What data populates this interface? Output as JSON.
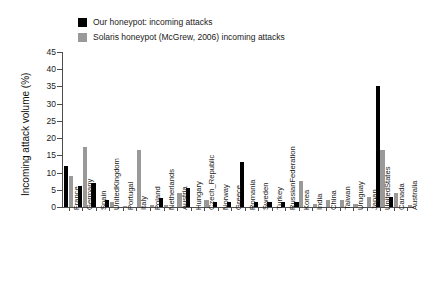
{
  "legend": {
    "position": "top-center",
    "entries": [
      {
        "label": "Our honeypot: incoming attacks",
        "color": "#000000",
        "swatch_name": "legend-swatch-our-honeypot"
      },
      {
        "label": "Solaris honeypot (McGrew, 2006) incoming attacks",
        "color": "#999999",
        "swatch_name": "legend-swatch-solaris-honeypot"
      }
    ]
  },
  "axes": {
    "ylabel": "Incoming attack volume (%)",
    "xlabel": "",
    "yticks": [
      0,
      5,
      10,
      15,
      20,
      25,
      30,
      35,
      40,
      45
    ],
    "ylim": [
      0,
      45
    ],
    "grid": false
  },
  "chart_data": {
    "type": "bar",
    "title": "",
    "xlabel": "",
    "ylabel": "Incoming attack volume (%)",
    "ylim": [
      0,
      45
    ],
    "grid": false,
    "legend_position": "top-center",
    "categories": [
      "France",
      "Germany",
      "Spain",
      "UnitedKingdom",
      "Portugal",
      "Italy",
      "Poland",
      "Netherlands",
      "Austria",
      "Hungary",
      "Czech_Republic",
      "Norway",
      "Greece",
      "Romania",
      "Sweden",
      "Turkey",
      "RussianFederation",
      "Korea",
      "India",
      "China",
      "Taiwan",
      "Uruguay",
      "Japan",
      "UnitedStates",
      "Canada",
      "Australia"
    ],
    "series": [
      {
        "name": "Our honeypot: incoming attacks",
        "color": "#000000",
        "values": [
          12,
          6,
          7,
          2,
          0,
          0,
          0,
          2.5,
          0,
          5.5,
          0,
          1.5,
          1.5,
          13,
          1.5,
          1.5,
          1.5,
          1.5,
          0,
          0,
          0,
          0,
          0,
          35,
          3,
          0
        ]
      },
      {
        "name": "Solaris honeypot (McGrew, 2006) incoming attacks",
        "color": "#999999",
        "values": [
          9,
          17.5,
          0,
          1.5,
          0.3,
          16.5,
          0.5,
          0.5,
          4,
          0,
          2,
          0,
          0,
          0,
          0,
          0,
          0,
          7.5,
          0.8,
          2,
          2,
          1,
          3,
          16.5,
          4,
          0.5
        ]
      }
    ]
  }
}
